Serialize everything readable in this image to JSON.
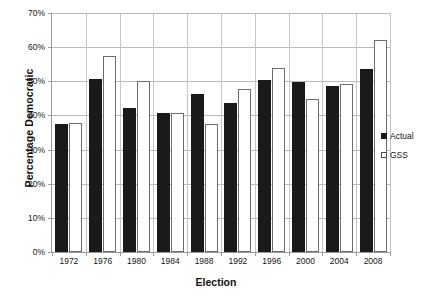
{
  "chart_data": {
    "type": "bar",
    "title": "",
    "xlabel": "Election",
    "ylabel": "Percentage Democratic",
    "categories": [
      "1972",
      "1976",
      "1980",
      "1984",
      "1988",
      "1992",
      "1996",
      "2000",
      "2004",
      "2008"
    ],
    "series": [
      {
        "name": "Actual",
        "color": "#1a1a1a",
        "values": [
          37.5,
          50.8,
          42.3,
          40.8,
          46.2,
          43.5,
          50.3,
          49.8,
          48.6,
          53.5
        ]
      },
      {
        "name": "GSS",
        "color": "#ffffff",
        "values": [
          37.8,
          57.5,
          50.2,
          40.8,
          37.6,
          47.8,
          54.0,
          44.9,
          49.2,
          62.2
        ]
      }
    ],
    "ylim": [
      0,
      70
    ],
    "ytick_values": [
      0,
      10,
      20,
      30,
      40,
      50,
      60,
      70
    ],
    "ytick_labels": [
      "0%",
      "10%",
      "20%",
      "30%",
      "40%",
      "50%",
      "60%",
      "70%"
    ],
    "grid": true,
    "legend_position": "right"
  },
  "legend": {
    "items": [
      {
        "label": "Actual",
        "swatch": "filled-black-square"
      },
      {
        "label": "GSS",
        "swatch": "open-white-square"
      }
    ]
  }
}
